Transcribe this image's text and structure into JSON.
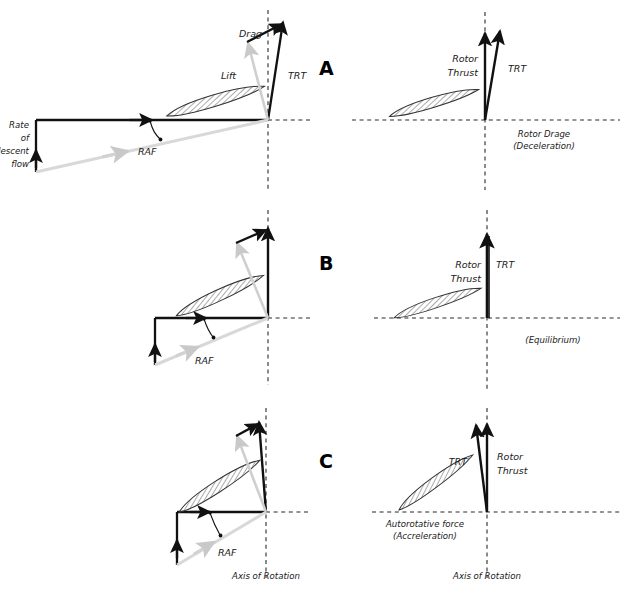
{
  "figure": {
    "title_letters": [
      "A",
      "B",
      "C"
    ],
    "colors": {
      "vector_dark": "#111111",
      "vector_light": "#c9c9c9",
      "dashed_axis": "#2b2b2b",
      "airfoil_stroke": "#333333",
      "background": "#ffffff"
    }
  },
  "panels": [
    {
      "id": "A",
      "letter": "A",
      "condition": "Deceleration",
      "left": {
        "vectors": [
          {
            "name": "Lift",
            "label": "Lift",
            "tone": "light"
          },
          {
            "name": "Drag",
            "label": "Drag",
            "tone": "dark"
          },
          {
            "name": "TRT",
            "label": "TRT",
            "tone": "dark"
          },
          {
            "name": "RAF",
            "label": "RAF",
            "tone": "light"
          },
          {
            "name": "Rate of descent flow",
            "label": "Rate\nof\ndescent\nflow",
            "tone": "dark"
          }
        ],
        "flow_label_lines": [
          "Rate",
          "of",
          "descent",
          "flow"
        ],
        "raf_label": "RAF",
        "lift_label": "Lift",
        "drag_label": "Drag",
        "trt_label": "TRT"
      },
      "right": {
        "rotor_thrust_label_lines": [
          "Rotor",
          "Thrust"
        ],
        "trt_label": "TRT",
        "condition_label_lines": [
          "Rotor Drage",
          "(Deceleration)"
        ]
      },
      "axis_label": ""
    },
    {
      "id": "B",
      "letter": "B",
      "condition": "Equilibrium",
      "left": {
        "flow_label_lines": [],
        "raf_label": "RAF",
        "lift_label": "",
        "drag_label": "",
        "trt_label": ""
      },
      "right": {
        "rotor_thrust_label_lines": [
          "Rotor",
          "Thrust"
        ],
        "trt_label": "TRT",
        "condition_label_lines": [
          "(Equilibrium)"
        ]
      },
      "axis_label": ""
    },
    {
      "id": "C",
      "letter": "C",
      "condition": "Acceleration",
      "left": {
        "flow_label_lines": [],
        "raf_label": "RAF",
        "lift_label": "",
        "drag_label": "",
        "trt_label": ""
      },
      "right": {
        "rotor_thrust_label_lines": [
          "Rotor",
          "Thrust"
        ],
        "trt_label": "TRT",
        "condition_label_lines": [
          "Autorotative force",
          "(Accreleration)"
        ]
      },
      "axis_label": "Axis of Rotation"
    }
  ],
  "axis_labels": {
    "left_bottom": "Axis of Rotation",
    "right_bottom": "Axis of Rotation"
  }
}
